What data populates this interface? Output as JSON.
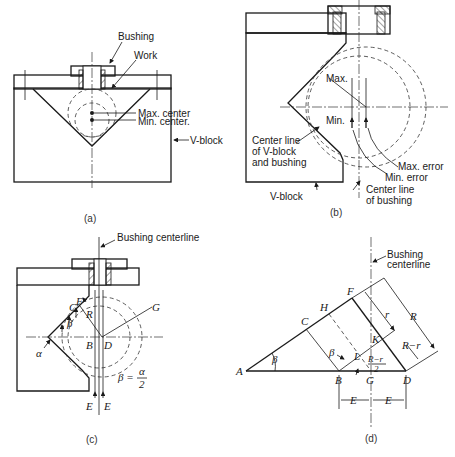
{
  "figure": {
    "panels": [
      {
        "id": "a",
        "caption": "(a)",
        "labels": {
          "bushing": "Bushing",
          "work": "Work",
          "max_center": "Max. center",
          "min_center": "Min. center.",
          "v_block": "V-block"
        }
      },
      {
        "id": "b",
        "caption": "(b)",
        "labels": {
          "max": "Max.",
          "min": "Min.",
          "center_line_vblock_1": "Center line",
          "center_line_vblock_2": "of V-block",
          "center_line_vblock_3": "and bushing",
          "max_error": "Max. error",
          "min_error": "Min. error",
          "center_line_bushing_1": "Center line",
          "center_line_bushing_2": "of bushing",
          "v_block": "V-block"
        }
      },
      {
        "id": "c",
        "caption": "(c)",
        "labels": {
          "bushing_centerline": "Bushing centerline",
          "F": "F",
          "C": "C",
          "R": "R",
          "beta": "β",
          "alpha": "α",
          "G": "G",
          "B": "B",
          "D": "D",
          "E_left": "E",
          "E_right": "E",
          "formula_lhs": "β =",
          "formula_num": "α",
          "formula_den": "2"
        }
      },
      {
        "id": "d",
        "caption": "(d)",
        "labels": {
          "bushing_1": "Bushing",
          "bushing_2": "centerline",
          "A": "A",
          "B": "B",
          "C": "C",
          "D": "D",
          "F": "F",
          "G": "G",
          "H": "H",
          "K": "K",
          "L": "L",
          "beta_A": "β",
          "beta_B": "β",
          "r": "r",
          "R": "R",
          "R_minus_r": "R−r",
          "half_num": "R−r",
          "half_den": "2",
          "E_left": "E",
          "E_right": "E"
        }
      }
    ]
  }
}
